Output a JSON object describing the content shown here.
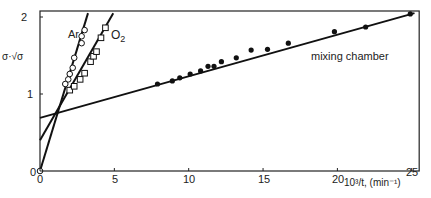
{
  "chart_data": {
    "type": "scatter",
    "title": "",
    "xlabel": "10³/t, (min⁻¹)",
    "ylabel": "σ·√σ",
    "xlim": [
      0,
      25.5
    ],
    "ylim": [
      0,
      2
    ],
    "x_ticks": [
      0,
      5,
      10,
      15,
      20,
      25
    ],
    "y_ticks": [
      0,
      1,
      2
    ],
    "grid": false,
    "legend": "inline labels",
    "series": [
      {
        "name": "Ar",
        "marker": "open-circle",
        "points": [
          [
            0,
            0
          ],
          [
            1.7,
            1.13
          ],
          [
            1.9,
            1.19
          ],
          [
            2.0,
            1.26
          ],
          [
            2.2,
            1.34
          ],
          [
            2.3,
            1.47
          ],
          [
            2.8,
            1.66
          ],
          [
            2.8,
            1.75
          ],
          [
            3.0,
            1.83
          ]
        ],
        "fit_line": {
          "intercept": 0.0,
          "slope": 0.635
        }
      },
      {
        "name": "O2",
        "marker": "open-square",
        "points": [
          [
            2.0,
            1.05
          ],
          [
            2.3,
            1.1
          ],
          [
            2.7,
            1.19
          ],
          [
            3.0,
            1.27
          ],
          [
            3.4,
            1.42
          ],
          [
            3.6,
            1.49
          ],
          [
            3.8,
            1.55
          ],
          [
            4.1,
            1.73
          ],
          [
            4.4,
            1.86
          ]
        ],
        "fit_line": {
          "intercept": 0.4,
          "slope": 0.335
        }
      },
      {
        "name": "mixing chamber",
        "marker": "filled-circle",
        "points": [
          [
            7.9,
            1.13
          ],
          [
            8.9,
            1.17
          ],
          [
            9.4,
            1.21
          ],
          [
            10.1,
            1.26
          ],
          [
            10.8,
            1.3
          ],
          [
            11.3,
            1.36
          ],
          [
            11.7,
            1.36
          ],
          [
            12.2,
            1.42
          ],
          [
            13.2,
            1.47
          ],
          [
            14.2,
            1.57
          ],
          [
            15.3,
            1.58
          ],
          [
            16.7,
            1.66
          ],
          [
            19.8,
            1.81
          ],
          [
            21.9,
            1.87
          ],
          [
            24.9,
            2.04
          ]
        ],
        "fit_line": {
          "intercept": 0.69,
          "slope": 0.054
        }
      }
    ],
    "annotations": [
      "Ar",
      "O2",
      "mixing chamber"
    ]
  },
  "labels": {
    "ylabel_main": "σ·√σ",
    "xlabel": "10³/t, (min⁻¹)",
    "ar": "Ar",
    "o2": "O",
    "o2_sub": "2",
    "mixing": "mixing chamber",
    "xticks": [
      "0",
      "5",
      "10",
      "15",
      "20",
      "25"
    ],
    "yticks": [
      "0",
      "1",
      "2"
    ]
  }
}
